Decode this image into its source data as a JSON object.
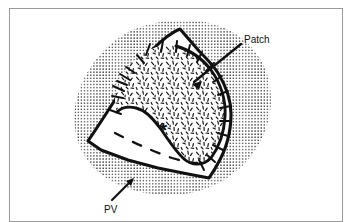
{
  "figure": {
    "caption_title": "",
    "kind": "surgical-anatomical-line-drawing",
    "background_color": "#ffffff",
    "ink_color": "#111111",
    "frame_color": "#9a9a9a",
    "annotations": [
      {
        "id": "patch",
        "label": "Patch",
        "text_x": 244,
        "text_y": 40,
        "leader": {
          "x1": 240,
          "y1": 44,
          "x2": 193,
          "y2": 82
        },
        "arrow_angle_deg": 219,
        "description": "leader line from the word Patch down-left onto the sutured patch graft"
      },
      {
        "id": "pv",
        "label": "PV",
        "text_x": 106,
        "text_y": 211,
        "leader": {
          "x1": 112,
          "y1": 201,
          "x2": 131,
          "y2": 181
        },
        "arrow_angle_deg": 313,
        "description": "leader line from the letters PV up-right into the stippled pulmonary vessel field"
      }
    ],
    "markers": [
      {
        "id": "asterisk",
        "glyph": "*",
        "x": 163,
        "y": 130,
        "size": 19,
        "description": "asterisk marking the open chamber below the patch"
      }
    ],
    "regions": [
      {
        "id": "stipple-field",
        "name": "stippled-background-tissue",
        "fill": "dot-stipple",
        "dot_color": "#111111",
        "dot_spacing_px": 3.1,
        "dot_radius_px": 0.72
      },
      {
        "id": "patch-graft",
        "name": "patch-graft",
        "fill": "short-dash-texture",
        "dash_color": "#111111"
      },
      {
        "id": "open-chamber",
        "name": "open-chamber",
        "fill": "white",
        "dashed_margin": true
      }
    ],
    "suture_count_patch_edge": 21
  }
}
